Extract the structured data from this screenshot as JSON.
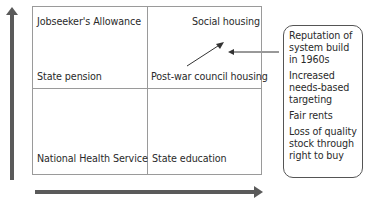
{
  "diagram": {
    "quadrants": {
      "top_left": {
        "top": "Jobseeker's Allowance",
        "bottom": "State pension"
      },
      "top_right": {
        "top": "Social housing",
        "bottom": "Post-war council housing"
      },
      "bottom_left": {
        "bottom": "National Health Service"
      },
      "bottom_right": {
        "bottom": "State education"
      }
    },
    "callout": {
      "items": [
        "Reputation of system build in 1960s",
        "Increased needs-based targeting",
        "Fair rents",
        "Loss of quality stock through right to buy"
      ]
    },
    "axes": {
      "vertical": "up-arrow",
      "horizontal": "right-arrow"
    },
    "colors": {
      "grid_line": "#9a9a9a",
      "axis_arrow": "#555555",
      "text": "#2a2a2a",
      "callout_border": "#555555"
    }
  }
}
